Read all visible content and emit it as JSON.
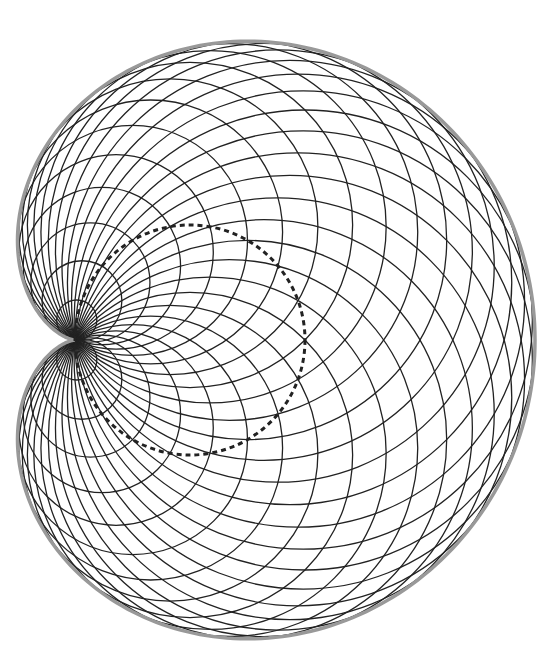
{
  "diagram": {
    "type": "cardioid-envelope-of-circles",
    "cusp": {
      "x": 75,
      "y": 340
    },
    "base_circle": {
      "cx": 190,
      "cy": 340,
      "r": 115,
      "style": "dotted",
      "color": "#222222"
    },
    "circle_family": {
      "count": 36,
      "color": "#222222",
      "stroke_width": 1.3
    },
    "envelope": {
      "color": "#999999",
      "stroke_width": 3.5
    }
  }
}
